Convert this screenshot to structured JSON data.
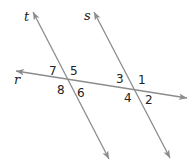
{
  "diagram": {
    "colors": {
      "line": "#8c8c8c",
      "text": "#222222",
      "background": "#ffffff"
    },
    "lines": [
      {
        "id": "t",
        "label": "t",
        "from": [
          33,
          12
        ],
        "to": [
          109,
          159
        ],
        "label_pos": [
          24,
          21
        ]
      },
      {
        "id": "s",
        "label": "s",
        "from": [
          94,
          12
        ],
        "to": [
          170,
          158
        ],
        "label_pos": [
          84,
          20
        ]
      },
      {
        "id": "r",
        "label": "r",
        "from": [
          16,
          71
        ],
        "to": [
          187,
          98
        ],
        "label_pos": [
          14,
          84
        ]
      }
    ],
    "angles": [
      {
        "label": "7",
        "pos": [
          49,
          75
        ]
      },
      {
        "label": "5",
        "pos": [
          70,
          75
        ]
      },
      {
        "label": "8",
        "pos": [
          57,
          94
        ]
      },
      {
        "label": "6",
        "pos": [
          77,
          97
        ]
      },
      {
        "label": "3",
        "pos": [
          116,
          83
        ]
      },
      {
        "label": "1",
        "pos": [
          138,
          84
        ]
      },
      {
        "label": "4",
        "pos": [
          124,
          102
        ]
      },
      {
        "label": "2",
        "pos": [
          145,
          104
        ]
      }
    ]
  }
}
